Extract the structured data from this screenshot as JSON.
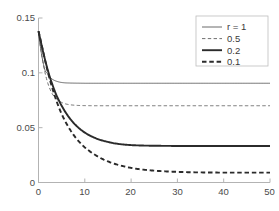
{
  "chart_data": {
    "type": "line",
    "title": "",
    "xlabel": "",
    "ylabel": "",
    "xlim": [
      0,
      50
    ],
    "ylim": [
      0,
      0.15
    ],
    "grid": false,
    "legend_position": "top-right",
    "xticks": [
      "0",
      "10",
      "20",
      "30",
      "40",
      "50"
    ],
    "xtick_values": [
      0,
      10,
      20,
      30,
      40,
      50
    ],
    "yticks": [
      "0",
      "0.05",
      "0.1",
      "0.15"
    ],
    "ytick_values": [
      0,
      0.05,
      0.1,
      0.15
    ],
    "legend_title_entry": "r = 1",
    "series": [
      {
        "name": "r = 1",
        "legend_label": "r = 1",
        "style": "solid",
        "width": "thin",
        "color": "#595959",
        "y0": 0.138,
        "asymptote": 0.0905,
        "decay_rate": 1.0,
        "x": [
          0,
          0.5,
          1,
          1.5,
          2,
          2.5,
          3,
          4,
          5,
          6,
          8,
          10,
          12,
          15,
          20,
          25,
          30,
          35,
          40,
          45,
          50
        ],
        "values": [
          0.138,
          0.1213,
          0.1095,
          0.1011,
          0.0993,
          0.0961,
          0.0941,
          0.0922,
          0.0912,
          0.0908,
          0.0906,
          0.0905,
          0.0905,
          0.0905,
          0.0905,
          0.0905,
          0.0905,
          0.0905,
          0.0905,
          0.0905,
          0.0905
        ]
      },
      {
        "name": "0.5",
        "legend_label": "0.5",
        "style": "dashed",
        "width": "thin",
        "color": "#606060",
        "y0": 0.138,
        "asymptote": 0.07,
        "decay_rate": 0.5,
        "x": [
          0,
          0.5,
          1,
          1.5,
          2,
          2.5,
          3,
          4,
          5,
          6,
          8,
          10,
          12,
          15,
          20,
          25,
          30,
          35,
          40,
          45,
          50
        ],
        "values": [
          0.138,
          0.1215,
          0.1088,
          0.0985,
          0.0907,
          0.085,
          0.0806,
          0.0758,
          0.073,
          0.0715,
          0.0704,
          0.0701,
          0.07,
          0.07,
          0.07,
          0.07,
          0.07,
          0.07,
          0.07,
          0.07,
          0.07
        ]
      },
      {
        "name": "0.2",
        "legend_label": "0.2",
        "style": "solid",
        "width": "thick",
        "color": "#2b2b2b",
        "y0": 0.138,
        "asymptote": 0.0333,
        "decay_rate": 0.22,
        "x": [
          0,
          0.5,
          1,
          1.5,
          2,
          2.5,
          3,
          4,
          5,
          6,
          8,
          10,
          12,
          15,
          18,
          20,
          25,
          30,
          35,
          40,
          45,
          50
        ],
        "values": [
          0.138,
          0.1285,
          0.119,
          0.1105,
          0.1025,
          0.0955,
          0.0893,
          0.0783,
          0.07,
          0.063,
          0.0525,
          0.0455,
          0.041,
          0.037,
          0.0348,
          0.0341,
          0.0335,
          0.0333,
          0.0333,
          0.0333,
          0.0333,
          0.0333
        ]
      },
      {
        "name": "0.1",
        "legend_label": "0.1",
        "style": "dashed",
        "width": "thick",
        "color": "#2b2b2b",
        "y0": 0.138,
        "asymptote": 0.009,
        "decay_rate": 0.145,
        "x": [
          0,
          0.5,
          1,
          1.5,
          2,
          2.5,
          3,
          4,
          5,
          6,
          8,
          10,
          12,
          15,
          18,
          20,
          25,
          30,
          35,
          40,
          45,
          50
        ],
        "values": [
          0.138,
          0.129,
          0.1195,
          0.11,
          0.101,
          0.093,
          0.0858,
          0.073,
          0.0625,
          0.054,
          0.041,
          0.032,
          0.0258,
          0.0192,
          0.0152,
          0.0133,
          0.0108,
          0.0097,
          0.0092,
          0.009,
          0.009,
          0.009
        ]
      }
    ]
  },
  "legend": {
    "entries": [
      {
        "label": "r = 1"
      },
      {
        "label": "0.5"
      },
      {
        "label": "0.2"
      },
      {
        "label": "0.1"
      }
    ]
  },
  "axes": {
    "x_tick_labels": [
      "0",
      "10",
      "20",
      "30",
      "40",
      "50"
    ],
    "y_tick_labels": [
      "0",
      "0.05",
      "0.1",
      "0.15"
    ]
  },
  "colors": {
    "axis": "#b0b0b0",
    "text": "#4a4a4a",
    "thin_line": "#5d5d5d",
    "thick_line": "#2b2b2b",
    "background": "#ffffff"
  }
}
